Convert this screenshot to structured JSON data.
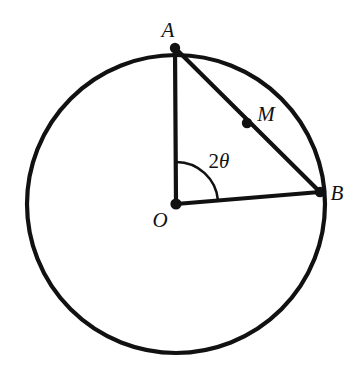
{
  "figure": {
    "background_color": "#ffffff",
    "stroke_color": "#111111",
    "width": 363,
    "height": 369
  },
  "circle": {
    "name": "circle-O",
    "center_x": 176,
    "center_y": 204,
    "radius": 149,
    "stroke_width": 4.2,
    "fill": "none"
  },
  "points": [
    {
      "id": "A",
      "label": "A",
      "x": 175,
      "y": 48,
      "label_x": 168,
      "label_y": 30,
      "dot_radius": 5.2,
      "on_circle": true
    },
    {
      "id": "B",
      "label": "B",
      "x": 320,
      "y": 192,
      "label_x": 337,
      "label_y": 193,
      "dot_radius": 5.2,
      "on_circle": true
    },
    {
      "id": "M",
      "label": "M",
      "x": 247,
      "y": 123,
      "label_x": 266,
      "label_y": 114,
      "dot_radius": 5.2,
      "on_circle": false
    },
    {
      "id": "O",
      "label": "O",
      "x": 176,
      "y": 204,
      "label_x": 160,
      "label_y": 220,
      "dot_radius": 5.6,
      "on_circle": false
    }
  ],
  "segments": [
    {
      "id": "OA",
      "name": "radius-OA",
      "x1": 176,
      "y1": 204,
      "x2": 175,
      "y2": 48,
      "stroke_width": 4.2
    },
    {
      "id": "OB",
      "name": "radius-OB",
      "x1": 176,
      "y1": 204,
      "x2": 320,
      "y2": 192,
      "stroke_width": 4.2
    },
    {
      "id": "AB",
      "name": "chord-AB",
      "x1": 175,
      "y1": 48,
      "x2": 320,
      "y2": 192,
      "stroke_width": 4.2
    }
  ],
  "angle": {
    "id": "AOB",
    "label": "2",
    "symbol": "θ",
    "label_x": 219,
    "label_y": 161,
    "arc_radius": 42,
    "arc_stroke_width": 2.6,
    "arc_path": "M 218 200.5 A 42 42 0 0 0 176.3 162",
    "vertex_x": 176,
    "vertex_y": 204,
    "start_deg": 4.8,
    "end_deg": 89.6
  }
}
